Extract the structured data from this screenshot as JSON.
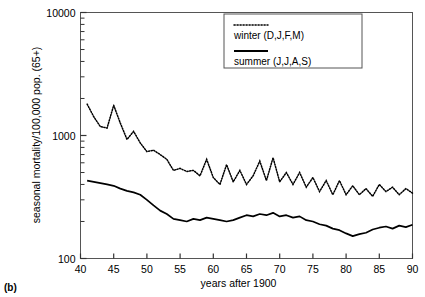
{
  "panel_label": "(b)",
  "chart_data": {
    "type": "line",
    "title": "",
    "subtitle": "",
    "xlabel": "years after 1900",
    "ylabel": "seasonal mortality/100,000 pop. (65+)",
    "yscale": "log",
    "ylim": [
      100,
      10000
    ],
    "xlim": [
      40,
      90
    ],
    "y_tick_labels": [
      "100",
      "1000",
      "10000"
    ],
    "y_ticks": [
      100,
      1000,
      10000
    ],
    "y_minor_ticks": [
      200,
      300,
      400,
      500,
      600,
      700,
      800,
      900,
      2000,
      3000,
      4000,
      5000,
      6000,
      7000,
      8000,
      9000
    ],
    "x_ticks": [
      40,
      45,
      50,
      55,
      60,
      65,
      70,
      75,
      80,
      85,
      90
    ],
    "x_tick_labels": [
      "40",
      "45",
      "50",
      "55",
      "60",
      "65",
      "70",
      "75",
      "80",
      "85",
      "90"
    ],
    "grid": false,
    "legend_position": "top-right",
    "legend_box": true,
    "colors": {
      "winter": "#000000",
      "summer": "#000000"
    },
    "series": [
      {
        "name": "winter (D,J,F,M)",
        "style": "dotted",
        "x": [
          41,
          42,
          43,
          44,
          45,
          46,
          47,
          48,
          49,
          50,
          51,
          52,
          53,
          54,
          55,
          56,
          57,
          58,
          59,
          60,
          61,
          62,
          63,
          64,
          65,
          66,
          67,
          68,
          69,
          70,
          71,
          72,
          73,
          74,
          75,
          76,
          77,
          78,
          79,
          80,
          81,
          82,
          83,
          84,
          85,
          86,
          87,
          88,
          89,
          90
        ],
        "values": [
          1800,
          1420,
          1180,
          1150,
          1760,
          1260,
          930,
          1080,
          870,
          740,
          760,
          700,
          640,
          520,
          540,
          510,
          520,
          470,
          640,
          455,
          400,
          580,
          420,
          520,
          400,
          470,
          620,
          430,
          660,
          420,
          500,
          400,
          500,
          380,
          455,
          350,
          430,
          330,
          430,
          330,
          390,
          330,
          370,
          320,
          400,
          350,
          380,
          330,
          370,
          340
        ]
      },
      {
        "name": "summer (J,J,A,S)",
        "style": "solid",
        "x": [
          41,
          42,
          43,
          44,
          45,
          46,
          47,
          48,
          49,
          50,
          51,
          52,
          53,
          54,
          55,
          56,
          57,
          58,
          59,
          60,
          61,
          62,
          63,
          64,
          65,
          66,
          67,
          68,
          69,
          70,
          71,
          72,
          73,
          74,
          75,
          76,
          77,
          78,
          79,
          80,
          81,
          82,
          83,
          84,
          85,
          86,
          87,
          88,
          89,
          90
        ],
        "values": [
          430,
          420,
          410,
          400,
          390,
          370,
          355,
          345,
          330,
          300,
          270,
          245,
          230,
          210,
          205,
          200,
          210,
          205,
          215,
          210,
          205,
          200,
          205,
          215,
          225,
          220,
          230,
          225,
          235,
          220,
          225,
          215,
          220,
          205,
          200,
          190,
          185,
          175,
          170,
          160,
          152,
          158,
          162,
          172,
          178,
          182,
          175,
          185,
          180,
          188
        ]
      }
    ]
  },
  "legend": {
    "entries": [
      {
        "label": "winter (D,J,F,M)",
        "marker": "dotted-line"
      },
      {
        "label": "summer (J,J,A,S)",
        "marker": "solid-line"
      }
    ]
  }
}
